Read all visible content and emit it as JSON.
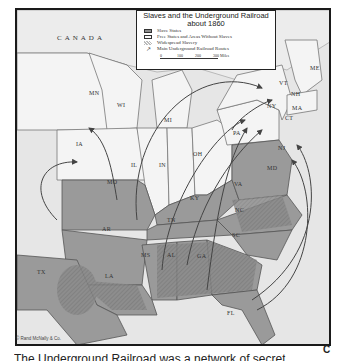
{
  "map": {
    "title_line1": "Slaves and the Underground Railroad",
    "title_line2": "about 1860",
    "legend": [
      {
        "swatch": "slave-states",
        "label": "Slave States"
      },
      {
        "swatch": "free-states",
        "label": "Free States and Areas Without Slaves"
      },
      {
        "swatch": "widespread-slavery",
        "label": "Widespread Slavery"
      },
      {
        "swatch": "route-arrow",
        "label": "Main Underground Railroad Routes"
      }
    ],
    "scale": {
      "ticks": [
        "0",
        "100",
        "200",
        "300 Miles"
      ]
    },
    "region_label": "CANADA",
    "states": {
      "MN": "MN",
      "WI": "WI",
      "MI": "MI",
      "IA": "IA",
      "IL": "IL",
      "IN": "IN",
      "OH": "OH",
      "PA": "PA",
      "NY": "NY",
      "VT": "VT",
      "NH": "NH",
      "ME": "ME",
      "MA": "MA",
      "CT": "CT",
      "NJ": "NJ",
      "MD": "MD",
      "MO": "MO",
      "KY": "KY",
      "VA": "VA",
      "NC": "NC",
      "TN": "TN",
      "AR": "AR",
      "SC": "SC",
      "MS": "MS",
      "AL": "AL",
      "GA": "GA",
      "LA": "LA",
      "TX": "TX",
      "FL": "FL"
    },
    "credit": "© Rand McNally & Co.",
    "colors": {
      "slave": "#8e8e8e",
      "free": "#f2f2f2",
      "water": "#e6e6e6",
      "border": "#1a1a1a"
    }
  },
  "caption": "The Underground Railroad was a network of secret",
  "corner_letter": "C"
}
